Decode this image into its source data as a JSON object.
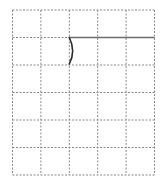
{
  "diagram": {
    "type": "grid-drawing",
    "grid": {
      "columns": 5,
      "rows": 6,
      "left": 12.5,
      "top": 10,
      "cell_width": 28.4,
      "cell_height": 27.5,
      "line_style": "dashed",
      "line_color": "#8a8a8a"
    },
    "shapes": [
      {
        "kind": "line",
        "name": "horizontal-segment",
        "from": [
          69.3,
          37.5
        ],
        "to": [
          154.5,
          37.5
        ],
        "color": "#6e6e6e"
      },
      {
        "kind": "arc",
        "name": "curved-arc",
        "from": [
          69.3,
          37.5
        ],
        "control": [
          76,
          51
        ],
        "to": [
          69.3,
          64
        ],
        "color": "#2a2a2a"
      }
    ]
  }
}
